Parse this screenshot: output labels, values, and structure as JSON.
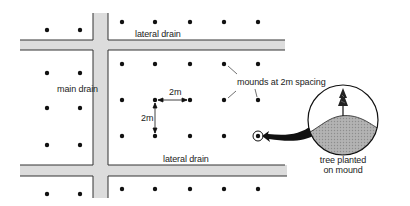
{
  "diagram": {
    "labels": {
      "top_lateral_drain": "lateral drain",
      "bottom_lateral_drain": "lateral drain",
      "main_drain": "main drain",
      "mounds": "mounds at 2m spacing",
      "horizontal_spacing": "2m",
      "vertical_spacing": "2m",
      "tree_caption_line1": "tree planted",
      "tree_caption_line2": "on mound"
    },
    "spacing_m": 2,
    "colors": {
      "drain_fill": "#dcdcdc",
      "mound_fill": "#a8a8a8",
      "ink": "#111111"
    },
    "icons": {
      "tree": "conifer-tree-icon",
      "highlighted_mound": "target-circle-icon",
      "callout_arrow": "curved-arrow-icon"
    }
  }
}
